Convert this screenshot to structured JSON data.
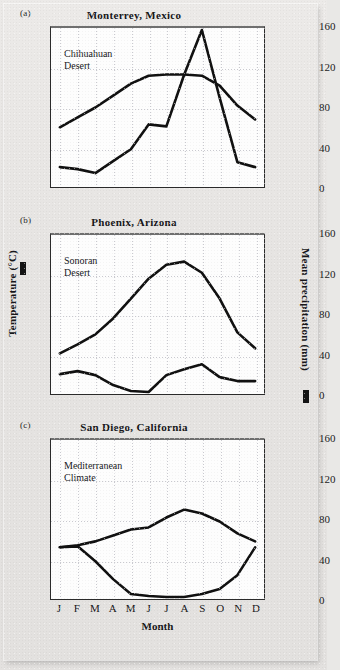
{
  "figure": {
    "axis_left_label": "Temperature (°C)",
    "axis_right_label": "Mean precipitation (mm)",
    "xaxis_title": "Month",
    "months": [
      "J",
      "F",
      "M",
      "A",
      "M",
      "J",
      "J",
      "A",
      "S",
      "O",
      "N",
      "D"
    ],
    "left_ticks": [
      "0",
      "10",
      "20",
      "30",
      "40"
    ],
    "right_ticks": [
      "0",
      "40",
      "80",
      "120",
      "160"
    ],
    "temp_color": "#111111",
    "precip_color": "#111111",
    "plot_bg": "#fdfdfd",
    "paper_bg": "#e9e8e6"
  },
  "panels": [
    {
      "tag": "(a)",
      "title": "Monterrey, Mexico",
      "annotation": "Chihuahuan\nDesert"
    },
    {
      "tag": "(b)",
      "title": "Phoenix, Arizona",
      "annotation": "Sonoran\nDesert"
    },
    {
      "tag": "(c)",
      "title": "San Diego, California",
      "annotation": "Mediterranean\nClimate"
    }
  ],
  "chart_data": [
    {
      "type": "line",
      "title": "Monterrey, Mexico",
      "subtitle": "Chihuahuan Desert",
      "xlabel": "Month",
      "ylabel": "Temperature (°C)",
      "y2label": "Mean precipitation (mm)",
      "categories": [
        "J",
        "F",
        "M",
        "A",
        "M",
        "J",
        "J",
        "A",
        "S",
        "O",
        "N",
        "D"
      ],
      "ylim": [
        0,
        40
      ],
      "y2lim": [
        0,
        160
      ],
      "grid": true,
      "legend": "none",
      "series": [
        {
          "name": "Temperature (°C)",
          "axis": "left",
          "values": [
            15.0,
            17.5,
            20.0,
            23.0,
            26.0,
            28.0,
            28.3,
            28.3,
            28.0,
            25.5,
            20.5,
            17.0
          ]
        },
        {
          "name": "Mean precipitation (mm)",
          "axis": "right",
          "values": [
            20.0,
            18.0,
            14.0,
            26.0,
            38.0,
            63.0,
            61.0,
            113.0,
            158.0,
            90.0,
            25.0,
            20.0
          ]
        }
      ]
    },
    {
      "type": "line",
      "title": "Phoenix, Arizona",
      "subtitle": "Sonoran Desert",
      "xlabel": "Month",
      "ylabel": "Temperature (°C)",
      "y2label": "Mean precipitation (mm)",
      "categories": [
        "J",
        "F",
        "M",
        "A",
        "M",
        "J",
        "J",
        "A",
        "S",
        "O",
        "N",
        "D"
      ],
      "ylim": [
        0,
        40
      ],
      "y2lim": [
        0,
        160
      ],
      "grid": true,
      "legend": "none",
      "series": [
        {
          "name": "Temperature (°C)",
          "axis": "left",
          "values": [
            10.2,
            12.5,
            15.0,
            19.0,
            24.0,
            29.0,
            32.5,
            33.3,
            30.5,
            24.0,
            15.5,
            11.5
          ]
        },
        {
          "name": "Mean precipitation (mm)",
          "axis": "right",
          "values": [
            20.0,
            23.0,
            19.0,
            9.0,
            3.0,
            2.0,
            19.0,
            25.0,
            30.0,
            17.0,
            13.0,
            13.0
          ]
        }
      ]
    },
    {
      "type": "line",
      "title": "San Diego, California",
      "subtitle": "Mediterranean Climate",
      "xlabel": "Month",
      "ylabel": "Temperature (°C)",
      "y2label": "Mean precipitation (mm)",
      "categories": [
        "J",
        "F",
        "M",
        "A",
        "M",
        "J",
        "J",
        "A",
        "S",
        "O",
        "N",
        "D"
      ],
      "ylim": [
        0,
        40
      ],
      "y2lim": [
        0,
        160
      ],
      "grid": true,
      "legend": "none",
      "series": [
        {
          "name": "Temperature (°C)",
          "axis": "left",
          "values": [
            13.0,
            13.5,
            14.5,
            16.0,
            17.5,
            18.0,
            20.5,
            22.5,
            21.5,
            19.5,
            16.5,
            14.5
          ]
        },
        {
          "name": "Mean precipitation (mm)",
          "axis": "right",
          "values": [
            52.0,
            53.0,
            38.0,
            20.0,
            5.0,
            3.0,
            2.0,
            2.0,
            5.0,
            10.0,
            24.0,
            52.0
          ]
        }
      ]
    }
  ]
}
